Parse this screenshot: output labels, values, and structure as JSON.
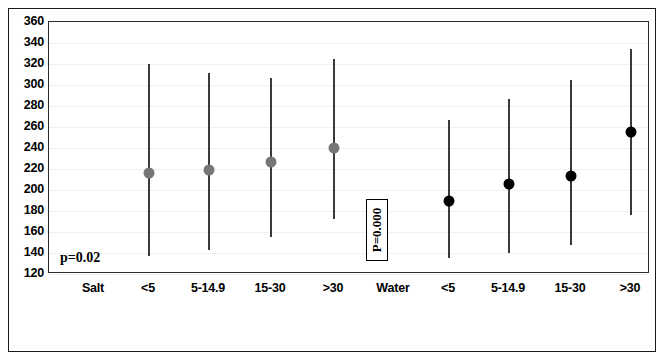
{
  "chart_data": {
    "type": "scatter",
    "title": "",
    "xlabel": "",
    "ylabel": "",
    "ylim": [
      120,
      360
    ],
    "ytick_step": 20,
    "yticks": [
      360,
      340,
      320,
      300,
      280,
      260,
      240,
      220,
      200,
      180,
      160,
      140,
      120
    ],
    "grid": true,
    "legend": "none",
    "categories": [
      "Salt",
      "<5",
      "5-14.9",
      "15-30",
      ">30",
      "Water",
      "<5",
      "5-14.9",
      "15-30",
      ">30"
    ],
    "annotations": [
      {
        "name": "salt-p-value",
        "text": "p=0.02",
        "boxed": false,
        "rotated": false
      },
      {
        "name": "water-p-value",
        "text": "P=0.000",
        "boxed": true,
        "rotated": true
      }
    ],
    "series": [
      {
        "name": "Salt",
        "color": "#767676",
        "group_label": "Salt",
        "points": [
          {
            "category": "<5",
            "value": 216,
            "low": 137,
            "high": 320
          },
          {
            "category": "5-14.9",
            "value": 219,
            "low": 143,
            "high": 311
          },
          {
            "category": "15-30",
            "value": 227,
            "low": 155,
            "high": 307
          },
          {
            "category": ">30",
            "value": 240,
            "low": 172,
            "high": 325
          }
        ]
      },
      {
        "name": "Water",
        "color": "#000000",
        "group_label": "Water",
        "points": [
          {
            "category": "<5",
            "value": 190,
            "low": 135,
            "high": 267
          },
          {
            "category": "5-14.9",
            "value": 206,
            "low": 140,
            "high": 287
          },
          {
            "category": "15-30",
            "value": 213,
            "low": 148,
            "high": 305
          },
          {
            "category": ">30",
            "value": 255,
            "low": 176,
            "high": 334
          }
        ]
      }
    ],
    "x_positions": {
      "Salt": 45,
      "Salt_<5": 100,
      "Salt_5-14.9": 160,
      "Salt_15-30": 222,
      "Salt_>30": 285,
      "Water": 345,
      "Water_<5": 400,
      "Water_5-14.9": 460,
      "Water_15-30": 522,
      "Water_>30": 582
    }
  }
}
